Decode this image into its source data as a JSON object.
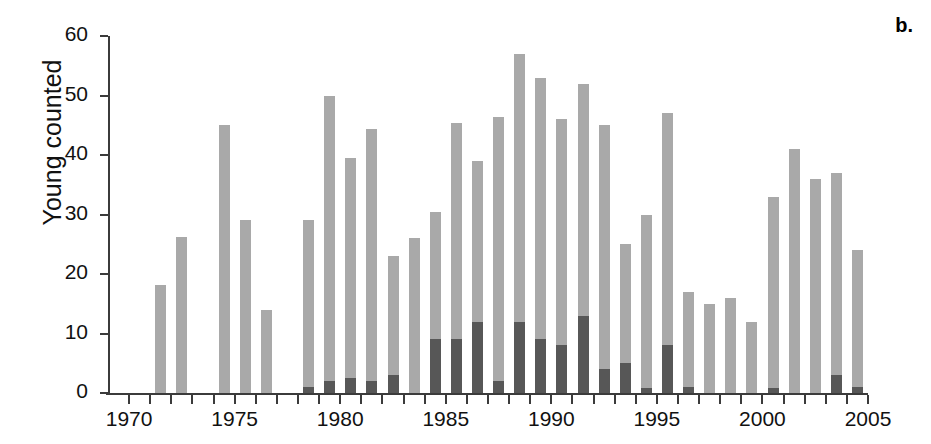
{
  "panel": {
    "label": "b."
  },
  "axes": {
    "ylabel": "Young counted",
    "xlabel": "",
    "yticks": [
      0,
      10,
      20,
      30,
      40,
      50,
      60
    ],
    "xticks": [
      1970,
      1975,
      1980,
      1985,
      1990,
      1995,
      2000,
      2005
    ],
    "xlim": [
      1969,
      2005
    ],
    "ylim": [
      0,
      60
    ],
    "grid": false
  },
  "colors": {
    "light_gray": "#a9a9a9",
    "dark_gray": "#575757",
    "axis": "#3b3b3b",
    "background": "#ffffff",
    "text": "#111111"
  },
  "chart_data": {
    "type": "bar",
    "title": "",
    "subtitle": "",
    "xlabel": "",
    "ylabel": "Young counted",
    "xlim": [
      1969,
      2005
    ],
    "ylim": [
      0,
      60
    ],
    "grid": false,
    "legend": null,
    "annotations": [
      "b."
    ],
    "categories": [
      1970,
      1971,
      1972,
      1973,
      1974,
      1975,
      1976,
      1977,
      1978,
      1979,
      1980,
      1981,
      1982,
      1983,
      1984,
      1985,
      1986,
      1987,
      1988,
      1989,
      1990,
      1991,
      1992,
      1993,
      1994,
      1995,
      1996,
      1997,
      1998,
      1999,
      2000,
      2001,
      2002,
      2003,
      2004
    ],
    "series": [
      {
        "name": "Young counted (total)",
        "color": "#a9a9a9",
        "values": [
          0,
          18.2,
          26.3,
          0,
          45,
          29,
          14,
          0,
          29,
          50,
          39.5,
          44.4,
          23,
          26,
          30.4,
          45.4,
          39,
          46.4,
          57,
          53,
          46,
          52,
          45,
          25,
          30,
          47,
          17,
          15,
          16,
          12,
          33,
          41,
          36,
          37,
          24
        ]
      },
      {
        "name": "Young counted (subset, overlaid)",
        "color": "#575757",
        "values": [
          0,
          0,
          0,
          0,
          0,
          0,
          0,
          0,
          1,
          2,
          2.5,
          2,
          3,
          0,
          9,
          9,
          12,
          2,
          12,
          9,
          8,
          13,
          4,
          5,
          0.8,
          8,
          1,
          0,
          0,
          0,
          0.8,
          0,
          0,
          3,
          1
        ]
      }
    ]
  }
}
